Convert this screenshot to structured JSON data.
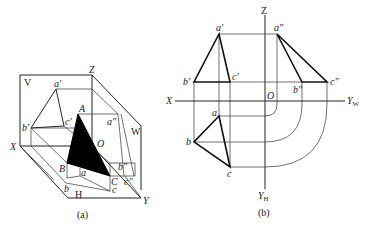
{
  "figure_a": {
    "caption": "(a)",
    "plane_labels": {
      "V": "V",
      "W": "W",
      "H": "H"
    },
    "axis_labels": {
      "X": "X",
      "Y": "Y",
      "Z": "Z",
      "O": "O"
    },
    "point_labels": {
      "A": "A",
      "B": "B",
      "C": "C",
      "a_prime": "a′",
      "b_prime": "b′",
      "c_prime": "c′",
      "a_dprime": "a″",
      "b_dprime": "b″",
      "c_dprime": "c″",
      "a": "a",
      "b": "b",
      "c": "c"
    }
  },
  "figure_b": {
    "caption": "(b)",
    "axis_labels": {
      "X": "X",
      "Z": "Z",
      "O": "O",
      "Y_W": "Y",
      "Y_W_sub": "W",
      "Y_H": "Y",
      "Y_H_sub": "H"
    },
    "point_labels": {
      "a_prime": "a′",
      "b_prime": "b′",
      "c_prime": "c′",
      "a_dprime": "a″",
      "b_dprime": "b″",
      "c_dprime": "c″",
      "a": "a",
      "b": "b",
      "c": "c"
    }
  }
}
